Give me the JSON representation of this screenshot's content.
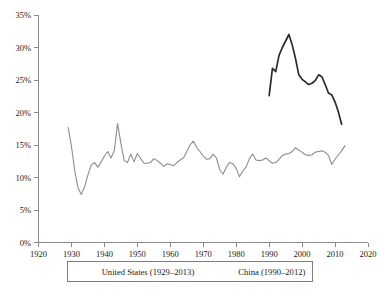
{
  "chart_data": {
    "type": "line",
    "title": "",
    "subtitle": "",
    "xlabel": "",
    "ylabel": "",
    "xlim": [
      1920,
      2020
    ],
    "ylim": [
      0,
      35
    ],
    "grid": false,
    "legend_position": "bottom-center",
    "x_ticks": [
      1920,
      1930,
      1940,
      1950,
      1960,
      1970,
      1980,
      1990,
      2000,
      2010,
      2020
    ],
    "x_tick_labels": [
      "1920",
      "1930",
      "1940",
      "1950",
      "1960",
      "1970",
      "1980",
      "1990",
      "2000",
      "2010",
      "2020"
    ],
    "y_ticks": [
      0,
      5,
      10,
      15,
      20,
      25,
      30,
      35
    ],
    "y_tick_labels": [
      "0%",
      "5%",
      "10%",
      "15%",
      "20%",
      "25%",
      "30%",
      "35%"
    ],
    "series": [
      {
        "name": "United States (1929–2013)",
        "color": "#8c8c8c",
        "width": 1.1,
        "x": [
          1929,
          1930,
          1931,
          1932,
          1933,
          1934,
          1935,
          1936,
          1937,
          1938,
          1939,
          1940,
          1941,
          1942,
          1943,
          1944,
          1945,
          1946,
          1947,
          1948,
          1949,
          1950,
          1951,
          1952,
          1953,
          1954,
          1955,
          1956,
          1957,
          1958,
          1959,
          1960,
          1961,
          1962,
          1963,
          1964,
          1965,
          1966,
          1967,
          1968,
          1969,
          1970,
          1971,
          1972,
          1973,
          1974,
          1975,
          1976,
          1977,
          1978,
          1979,
          1980,
          1981,
          1982,
          1983,
          1984,
          1985,
          1986,
          1987,
          1988,
          1989,
          1990,
          1991,
          1992,
          1993,
          1994,
          1995,
          1996,
          1997,
          1998,
          1999,
          2000,
          2001,
          2002,
          2003,
          2004,
          2005,
          2006,
          2007,
          2008,
          2009,
          2010,
          2011,
          2012,
          2013
        ],
        "y": [
          17.7,
          14.8,
          11.0,
          8.4,
          7.4,
          8.6,
          10.4,
          11.9,
          12.3,
          11.6,
          12.4,
          13.3,
          14.0,
          13.0,
          14.1,
          18.3,
          15.3,
          12.6,
          12.3,
          13.6,
          12.4,
          13.7,
          12.9,
          12.2,
          12.2,
          12.3,
          12.9,
          12.6,
          12.2,
          11.7,
          12.1,
          12.0,
          11.8,
          12.3,
          12.7,
          13.0,
          14.0,
          15.0,
          15.6,
          14.6,
          14.0,
          13.3,
          12.8,
          12.9,
          13.6,
          13.0,
          11.2,
          10.5,
          11.6,
          12.3,
          12.1,
          11.4,
          10.1,
          11.0,
          11.6,
          12.9,
          13.6,
          12.7,
          12.6,
          12.7,
          13.0,
          12.6,
          12.2,
          12.3,
          12.8,
          13.4,
          13.6,
          13.7,
          14.0,
          14.6,
          14.2,
          13.9,
          13.5,
          13.4,
          13.5,
          13.9,
          14.0,
          14.1,
          13.9,
          13.4,
          12.0,
          12.8,
          13.5,
          14.1,
          14.9
        ]
      },
      {
        "name": "China (1990–2012)",
        "color": "#2b2b2b",
        "width": 1.7,
        "x": [
          1990,
          1991,
          1992,
          1993,
          1994,
          1995,
          1996,
          1997,
          1998,
          1999,
          2000,
          2001,
          2002,
          2003,
          2004,
          2005,
          2006,
          2007,
          2008,
          2009,
          2010,
          2011,
          2012
        ],
        "y": [
          22.6,
          26.8,
          26.3,
          28.8,
          30.0,
          31.0,
          32.0,
          30.4,
          28.3,
          25.8,
          25.1,
          24.7,
          24.3,
          24.5,
          24.9,
          25.8,
          25.5,
          24.3,
          23.0,
          22.7,
          21.6,
          20.1,
          18.2
        ]
      }
    ]
  },
  "legend": {
    "entries": [
      {
        "label": "United States (1929–2013)"
      },
      {
        "label": "China (1990–2012)"
      }
    ]
  }
}
